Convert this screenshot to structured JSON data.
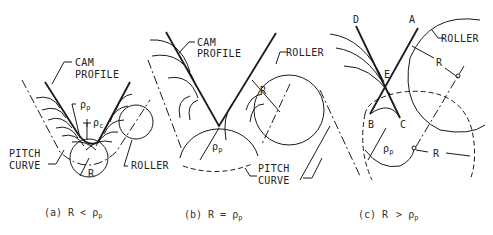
{
  "figure": {
    "panels": [
      {
        "id": "a",
        "caption_prefix": "(a) R",
        "caption_op": "<",
        "caption_rho": "ρ",
        "caption_sub": "p",
        "labels": {
          "cam_profile_1": "CAM",
          "cam_profile_2": "PROFILE",
          "pitch_curve_1": "PITCH",
          "pitch_curve_2": "CURVE",
          "roller": "ROLLER",
          "rho_p": "ρ",
          "rho_p_sub": "p",
          "rho_c": "ρ",
          "rho_c_sub": "c",
          "r": "R"
        }
      },
      {
        "id": "b",
        "caption_prefix": "(b) R",
        "caption_op": "=",
        "caption_rho": "ρ",
        "caption_sub": "p",
        "labels": {
          "cam_profile_1": "CAM",
          "cam_profile_2": "PROFILE",
          "pitch_curve_1": "PITCH",
          "pitch_curve_2": "CURVE",
          "roller": "ROLLER",
          "rho_p": "ρ",
          "rho_p_sub": "p",
          "r": "R"
        }
      },
      {
        "id": "c",
        "caption_prefix": "(c)  R",
        "caption_op": ">",
        "caption_rho": "ρ",
        "caption_sub": "p",
        "labels": {
          "roller": "ROLLER",
          "point_a": "A",
          "point_b": "B",
          "point_c": "C",
          "point_d": "D",
          "point_e": "E",
          "r_top": "R",
          "r_bottom": "R",
          "rho_p": "ρ",
          "rho_p_sub": "p"
        }
      }
    ]
  }
}
